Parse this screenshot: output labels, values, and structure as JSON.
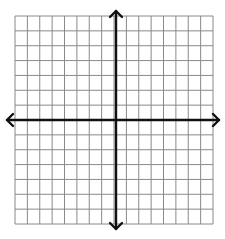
{
  "diagram": {
    "type": "coordinate-plane",
    "grid": {
      "columns": 16,
      "rows": 14,
      "left": 15,
      "top": 16,
      "right": 213,
      "bottom": 224,
      "line_color": "#8a8a8a",
      "line_width": 1
    },
    "axes": {
      "x_axis_y": 120,
      "y_axis_x": 116,
      "x_axis_extent": [
        7,
        219
      ],
      "y_axis_extent": [
        11,
        229
      ],
      "color": "#111111",
      "width": 2.4,
      "arrowheads": [
        "left",
        "right",
        "up",
        "down"
      ]
    },
    "labels": []
  }
}
